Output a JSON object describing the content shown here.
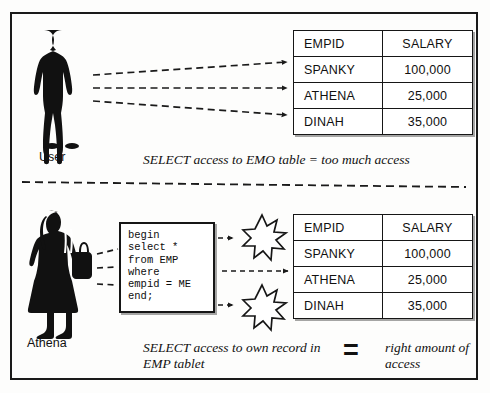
{
  "diagram": {
    "title_hidden": "",
    "sections": {
      "top": {
        "actor_label": "User",
        "actor_icon": "male-user-silhouette",
        "caption": "SELECT access to EMO table = too much access",
        "table": {
          "headers": [
            "EMPID",
            "SALARY"
          ],
          "rows": [
            [
              "SPANKY",
              "100,000"
            ],
            [
              "ATHENA",
              "25,000"
            ],
            [
              "DINAH",
              "35,000"
            ]
          ]
        }
      },
      "bottom": {
        "actor_label": "Athena",
        "actor_icon": "female-user-silhouette",
        "code": "begin\nselect *\nfrom EMP\nwhere\nempid = ME\nend;",
        "burst_icon": "starburst-icon",
        "caption_left": "SELECT access to own record in EMP tablet",
        "equals": "=",
        "caption_right": "right amount of access",
        "table": {
          "headers": [
            "EMPID",
            "SALARY"
          ],
          "rows": [
            [
              "SPANKY",
              "100,000"
            ],
            [
              "ATHENA",
              "25,000"
            ],
            [
              "DINAH",
              "35,000"
            ]
          ]
        }
      }
    },
    "colors": {
      "ink": "#161616",
      "paper": "#ffffff",
      "silhouette": "#111111"
    }
  }
}
